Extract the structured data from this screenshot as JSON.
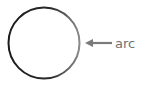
{
  "diagram": {
    "shape": "circle",
    "label": "arc",
    "colors": {
      "stroke_dark": "#1a1a1a",
      "stroke_light": "#8a8a8a",
      "arrow": "#7a7a7a",
      "label": "#707070"
    }
  }
}
